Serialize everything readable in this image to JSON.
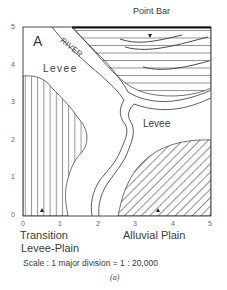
{
  "figure": {
    "panel_letter": "A",
    "top_label": "Point Bar",
    "river_label": "RIVER",
    "regions": {
      "levee_upper_left": "Levee",
      "levee_center_right": "Levee",
      "transition_line1": "Transition",
      "transition_line2": "Levee-Plain",
      "alluvial_plain": "Alluvial Plain"
    },
    "x_ticks": [
      "0",
      "1",
      "2",
      "3",
      "4",
      "5"
    ],
    "y_ticks": [
      "0",
      "1",
      "2",
      "3",
      "4",
      "5"
    ],
    "scale_text": "Scale : 1 major division = 1 : 20,000",
    "subcaption": "(a)",
    "colors": {
      "ink": "#333333",
      "background": "#ffffff"
    }
  }
}
